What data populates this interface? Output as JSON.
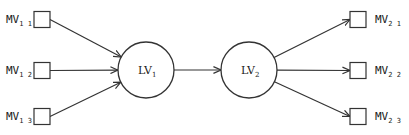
{
  "diagram": {
    "latent_variables": [
      {
        "id": "LV1",
        "label": "LV",
        "subscript": "1"
      },
      {
        "id": "LV2",
        "label": "LV",
        "subscript": "2"
      }
    ],
    "manifest_variables": [
      {
        "id": "MV11",
        "label": "MV",
        "subscript": "1 1",
        "group": "LV1"
      },
      {
        "id": "MV12",
        "label": "MV",
        "subscript": "1 2",
        "group": "LV1"
      },
      {
        "id": "MV13",
        "label": "MV",
        "subscript": "1 3",
        "group": "LV1"
      },
      {
        "id": "MV21",
        "label": "MV",
        "subscript": "2 1",
        "group": "LV2"
      },
      {
        "id": "MV22",
        "label": "MV",
        "subscript": "2 2",
        "group": "LV2"
      },
      {
        "id": "MV23",
        "label": "MV",
        "subscript": "2 3",
        "group": "LV2"
      }
    ],
    "edges": [
      {
        "from": "MV11",
        "to": "LV1"
      },
      {
        "from": "MV12",
        "to": "LV1"
      },
      {
        "from": "MV13",
        "to": "LV1"
      },
      {
        "from": "LV1",
        "to": "LV2"
      },
      {
        "from": "LV2",
        "to": "MV21"
      },
      {
        "from": "LV2",
        "to": "MV22"
      },
      {
        "from": "LV2",
        "to": "MV23"
      }
    ]
  }
}
